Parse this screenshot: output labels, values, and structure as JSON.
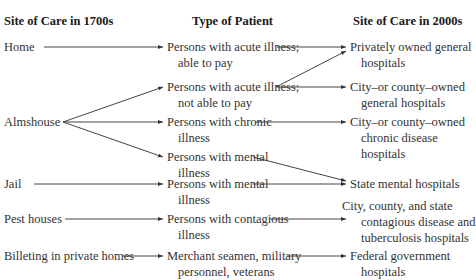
{
  "headers": {
    "col1": "Site of Care in 1700s",
    "col2": "Type of Patient",
    "col3": "Site of Care in 2000s"
  },
  "sites_1700s": [
    {
      "id": "home",
      "label": "Home"
    },
    {
      "id": "almshouse",
      "label": "Almshouse"
    },
    {
      "id": "jail",
      "label": "Jail"
    },
    {
      "id": "pest",
      "label": "Pest houses"
    },
    {
      "id": "billeting",
      "label": "Billeting in private homes"
    }
  ],
  "patients": [
    {
      "id": "acute_pay",
      "line1": "Persons with acute illness;",
      "line2": "able to pay"
    },
    {
      "id": "acute_nopay",
      "line1": "Persons with acute illness;",
      "line2": "not able to pay"
    },
    {
      "id": "chronic",
      "line1": "Persons with chronic",
      "line2": "illness"
    },
    {
      "id": "mental_alms",
      "line1": "Persons with mental",
      "line2": "illness"
    },
    {
      "id": "mental_jail",
      "line1": "Persons with mental",
      "line2": "illness"
    },
    {
      "id": "contagious",
      "line1": "Persons with contagious",
      "line2": "illness"
    },
    {
      "id": "merchant",
      "line1": "Merchant seamen, military",
      "line2": "personnel, veterans"
    }
  ],
  "sites_2000s": [
    {
      "id": "private",
      "line1": "Privately owned general",
      "line2": "hospitals"
    },
    {
      "id": "city_general",
      "line1": "City–or county–owned",
      "line2": "general hospitals"
    },
    {
      "id": "city_chronic",
      "line1": "City–or county–owned",
      "line2": "chronic disease",
      "line3": "hospitals"
    },
    {
      "id": "state_mental",
      "line1": "State mental hospitals"
    },
    {
      "id": "contagious_hosp",
      "line1": "City, county, and state",
      "line2": "contagious disease and",
      "line3": "tuberculosis hospitals"
    },
    {
      "id": "federal",
      "line1": "Federal government",
      "line2": "hospitals"
    }
  ],
  "connections": [
    [
      "home",
      "acute_pay"
    ],
    [
      "almshouse",
      "acute_nopay"
    ],
    [
      "almshouse",
      "chronic"
    ],
    [
      "almshouse",
      "mental_alms"
    ],
    [
      "jail",
      "mental_jail"
    ],
    [
      "pest",
      "contagious"
    ],
    [
      "billeting",
      "merchant"
    ],
    [
      "acute_pay",
      "private"
    ],
    [
      "acute_nopay",
      "private"
    ],
    [
      "acute_nopay",
      "city_general"
    ],
    [
      "chronic",
      "city_chronic"
    ],
    [
      "mental_alms",
      "state_mental"
    ],
    [
      "mental_jail",
      "state_mental"
    ],
    [
      "contagious",
      "contagious_hosp"
    ],
    [
      "merchant",
      "federal"
    ]
  ]
}
